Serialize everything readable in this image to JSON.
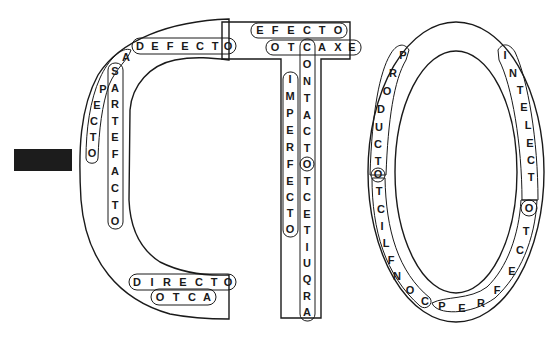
{
  "puzzle": {
    "title_letters": [
      "C",
      "T",
      "O"
    ],
    "colors": {
      "ink": "#1a1a1a",
      "background": "#ffffff",
      "redaction": "#1c1c1c"
    },
    "words": [
      {
        "id": "defecto",
        "text": "DEFECTO",
        "direction": "horizontal",
        "shape": "C"
      },
      {
        "id": "aspecto",
        "text": "ASPECTO",
        "direction": "curve-down",
        "shape": "C"
      },
      {
        "id": "artefacto",
        "text": "ARTEFACTO",
        "direction": "vertical",
        "shape": "C"
      },
      {
        "id": "directo",
        "text": "DIRECTO",
        "direction": "horizontal",
        "shape": "C"
      },
      {
        "id": "acto",
        "text": "ACTO",
        "display": "OTCA",
        "direction": "horizontal-reversed",
        "shape": "C"
      },
      {
        "id": "efecto",
        "text": "EFECTO",
        "direction": "horizontal",
        "shape": "T"
      },
      {
        "id": "exacto",
        "text": "EXACTO",
        "display": "OTCAXE",
        "direction": "horizontal-reversed",
        "shape": "T"
      },
      {
        "id": "contacto",
        "text": "CONTACTO",
        "direction": "vertical",
        "shape": "T"
      },
      {
        "id": "arquitecto",
        "text": "ARQUITECTO",
        "display": "OTCETIUQRA",
        "direction": "vertical-reversed",
        "shape": "T"
      },
      {
        "id": "imperfecto",
        "text": "IMPERFECTO",
        "direction": "vertical",
        "shape": "T"
      },
      {
        "id": "producto",
        "text": "PRODUCTO",
        "direction": "curve",
        "shape": "O"
      },
      {
        "id": "conflicto",
        "text": "CONFLICTO",
        "display": "OTCILFNOC",
        "direction": "curve-reversed",
        "shape": "O"
      },
      {
        "id": "perfecto",
        "text": "PERFECTO",
        "direction": "curve",
        "shape": "O"
      },
      {
        "id": "intelecto",
        "text": "INTELECTO",
        "direction": "curve",
        "shape": "O"
      }
    ],
    "letters": {
      "c_defecto": [
        {
          "ch": "D",
          "x": 140,
          "y": 46
        },
        {
          "ch": "E",
          "x": 155,
          "y": 46
        },
        {
          "ch": "F",
          "x": 170,
          "y": 46
        },
        {
          "ch": "E",
          "x": 185,
          "y": 46
        },
        {
          "ch": "C",
          "x": 200,
          "y": 46
        },
        {
          "ch": "T",
          "x": 215,
          "y": 46
        },
        {
          "ch": "O",
          "x": 228,
          "y": 46
        }
      ],
      "c_aspecto": [
        {
          "ch": "A",
          "x": 126,
          "y": 57
        },
        {
          "ch": "S",
          "x": 115,
          "y": 71
        },
        {
          "ch": "P",
          "x": 103,
          "y": 89
        },
        {
          "ch": "E",
          "x": 97,
          "y": 105
        },
        {
          "ch": "C",
          "x": 94,
          "y": 121
        },
        {
          "ch": "T",
          "x": 93,
          "y": 137
        },
        {
          "ch": "O",
          "x": 92,
          "y": 153
        }
      ],
      "c_artefacto": [
        {
          "ch": "A",
          "x": 115,
          "y": 88
        },
        {
          "ch": "R",
          "x": 115,
          "y": 104
        },
        {
          "ch": "T",
          "x": 115,
          "y": 121
        },
        {
          "ch": "E",
          "x": 115,
          "y": 137
        },
        {
          "ch": "F",
          "x": 115,
          "y": 154
        },
        {
          "ch": "A",
          "x": 115,
          "y": 171
        },
        {
          "ch": "C",
          "x": 115,
          "y": 188
        },
        {
          "ch": "T",
          "x": 115,
          "y": 205
        },
        {
          "ch": "O",
          "x": 115,
          "y": 221
        }
      ],
      "c_directo": [
        {
          "ch": "D",
          "x": 137,
          "y": 282
        },
        {
          "ch": "I",
          "x": 152,
          "y": 282
        },
        {
          "ch": "R",
          "x": 167,
          "y": 282
        },
        {
          "ch": "E",
          "x": 183,
          "y": 282
        },
        {
          "ch": "C",
          "x": 199,
          "y": 282
        },
        {
          "ch": "T",
          "x": 214,
          "y": 282
        },
        {
          "ch": "O",
          "x": 228,
          "y": 282
        }
      ],
      "c_otca": [
        {
          "ch": "O",
          "x": 160,
          "y": 297
        },
        {
          "ch": "T",
          "x": 176,
          "y": 297
        },
        {
          "ch": "C",
          "x": 192,
          "y": 297
        },
        {
          "ch": "A",
          "x": 207,
          "y": 297
        }
      ],
      "t_efecto": [
        {
          "ch": "E",
          "x": 260,
          "y": 30
        },
        {
          "ch": "F",
          "x": 275,
          "y": 30
        },
        {
          "ch": "E",
          "x": 291,
          "y": 30
        },
        {
          "ch": "C",
          "x": 307,
          "y": 30
        },
        {
          "ch": "T",
          "x": 322,
          "y": 30
        },
        {
          "ch": "O",
          "x": 338,
          "y": 30
        }
      ],
      "t_otcaxe": [
        {
          "ch": "O",
          "x": 275,
          "y": 47
        },
        {
          "ch": "T",
          "x": 291,
          "y": 47
        },
        {
          "ch": "C",
          "x": 307,
          "y": 47
        },
        {
          "ch": "A",
          "x": 322,
          "y": 47
        },
        {
          "ch": "X",
          "x": 338,
          "y": 47
        },
        {
          "ch": "E",
          "x": 352,
          "y": 47
        }
      ],
      "t_contacto_column": [
        {
          "ch": "O",
          "x": 307,
          "y": 64
        },
        {
          "ch": "N",
          "x": 307,
          "y": 81
        },
        {
          "ch": "T",
          "x": 307,
          "y": 98
        },
        {
          "ch": "A",
          "x": 307,
          "y": 115
        },
        {
          "ch": "C",
          "x": 307,
          "y": 131
        },
        {
          "ch": "T",
          "x": 307,
          "y": 148
        },
        {
          "ch": "O",
          "x": 307,
          "y": 164
        },
        {
          "ch": "T",
          "x": 307,
          "y": 181
        },
        {
          "ch": "C",
          "x": 307,
          "y": 197
        },
        {
          "ch": "E",
          "x": 307,
          "y": 214
        },
        {
          "ch": "T",
          "x": 307,
          "y": 230
        },
        {
          "ch": "I",
          "x": 307,
          "y": 247
        },
        {
          "ch": "U",
          "x": 307,
          "y": 263
        },
        {
          "ch": "Q",
          "x": 307,
          "y": 279
        },
        {
          "ch": "R",
          "x": 307,
          "y": 296
        },
        {
          "ch": "A",
          "x": 307,
          "y": 312
        }
      ],
      "t_imperfecto": [
        {
          "ch": "I",
          "x": 290,
          "y": 79
        },
        {
          "ch": "M",
          "x": 290,
          "y": 96
        },
        {
          "ch": "P",
          "x": 290,
          "y": 113
        },
        {
          "ch": "E",
          "x": 290,
          "y": 130
        },
        {
          "ch": "R",
          "x": 290,
          "y": 147
        },
        {
          "ch": "F",
          "x": 290,
          "y": 164
        },
        {
          "ch": "E",
          "x": 290,
          "y": 181
        },
        {
          "ch": "C",
          "x": 290,
          "y": 197
        },
        {
          "ch": "T",
          "x": 290,
          "y": 213
        },
        {
          "ch": "O",
          "x": 290,
          "y": 229
        }
      ],
      "o_producto": [
        {
          "ch": "P",
          "x": 403,
          "y": 55
        },
        {
          "ch": "R",
          "x": 393,
          "y": 73
        },
        {
          "ch": "O",
          "x": 387,
          "y": 91
        },
        {
          "ch": "D",
          "x": 381,
          "y": 109
        },
        {
          "ch": "U",
          "x": 379,
          "y": 127
        },
        {
          "ch": "C",
          "x": 378,
          "y": 144
        },
        {
          "ch": "T",
          "x": 378,
          "y": 161
        },
        {
          "ch": "O",
          "x": 378,
          "y": 174
        }
      ],
      "o_conflicto_rest": [
        {
          "ch": "T",
          "x": 379,
          "y": 191
        },
        {
          "ch": "C",
          "x": 381,
          "y": 209
        },
        {
          "ch": "I",
          "x": 382,
          "y": 226
        },
        {
          "ch": "L",
          "x": 386,
          "y": 243
        },
        {
          "ch": "F",
          "x": 391,
          "y": 260
        },
        {
          "ch": "N",
          "x": 397,
          "y": 276
        },
        {
          "ch": "O",
          "x": 410,
          "y": 290
        },
        {
          "ch": "C",
          "x": 425,
          "y": 301
        }
      ],
      "o_perfecto": [
        {
          "ch": "P",
          "x": 442,
          "y": 306
        },
        {
          "ch": "E",
          "x": 462,
          "y": 308
        },
        {
          "ch": "R",
          "x": 481,
          "y": 303
        },
        {
          "ch": "F",
          "x": 497,
          "y": 290
        },
        {
          "ch": "E",
          "x": 512,
          "y": 271
        },
        {
          "ch": "C",
          "x": 520,
          "y": 250
        },
        {
          "ch": "T",
          "x": 526,
          "y": 231
        }
      ],
      "o_intelecto": [
        {
          "ch": "I",
          "x": 505,
          "y": 55
        },
        {
          "ch": "N",
          "x": 513,
          "y": 73
        },
        {
          "ch": "T",
          "x": 520,
          "y": 90
        },
        {
          "ch": "E",
          "x": 524,
          "y": 107
        },
        {
          "ch": "L",
          "x": 528,
          "y": 125
        },
        {
          "ch": "E",
          "x": 530,
          "y": 143
        },
        {
          "ch": "C",
          "x": 531,
          "y": 160
        },
        {
          "ch": "T",
          "x": 531,
          "y": 177
        },
        {
          "ch": "O",
          "x": 529,
          "y": 208
        }
      ]
    }
  }
}
